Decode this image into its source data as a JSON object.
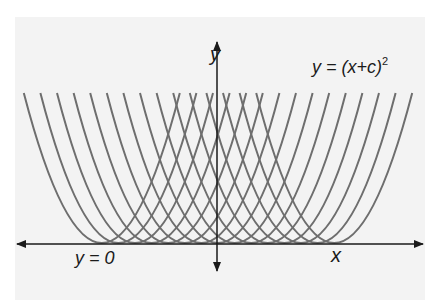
{
  "diagram": {
    "title_formula": {
      "base": "y = (x+c)",
      "exponent": "2"
    },
    "axis_labels": {
      "y": "y",
      "x": "x"
    },
    "envelope_label": "y = 0",
    "colors": {
      "curve": "#6e6e6e",
      "axis": "#1a1a1a",
      "panel": "#f3f3f3"
    }
  },
  "chart_data": {
    "type": "line",
    "series_count": 15,
    "c_values": [
      7,
      6,
      5,
      4,
      3,
      2,
      1,
      0,
      -1,
      -2,
      -3,
      -4,
      -5,
      -6,
      -7
    ],
    "xlabel": "x",
    "ylabel": "y",
    "annotations": [
      "y = (x+c)^2",
      "y = 0"
    ],
    "grid": false
  }
}
